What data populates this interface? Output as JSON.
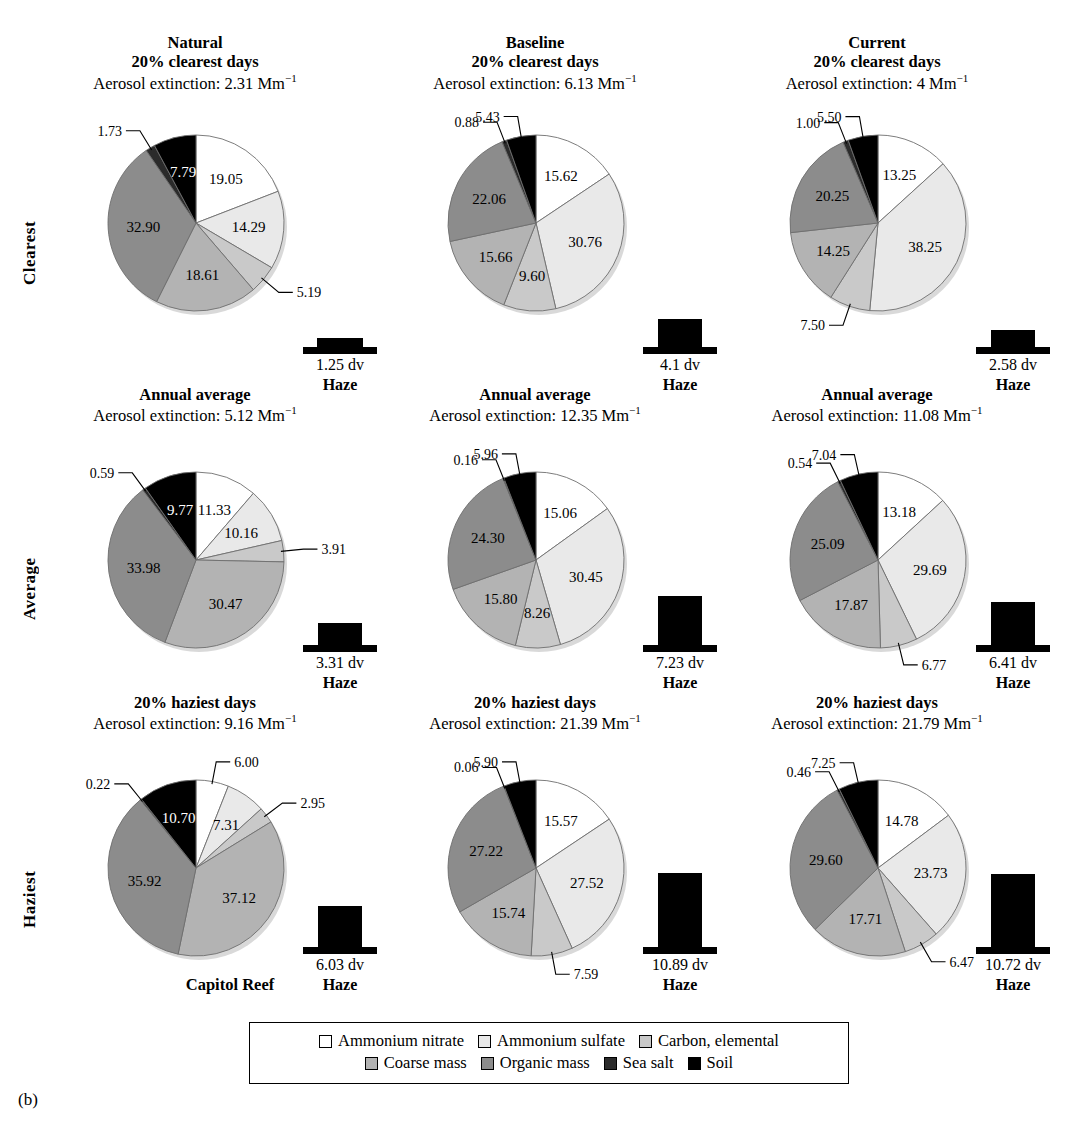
{
  "caption": "(b)",
  "site_label": "Capitol Reef",
  "row_labels": [
    "Clearest",
    "Average",
    "Haziest"
  ],
  "column_titles": [
    "Natural",
    "Baseline",
    "Current"
  ],
  "extinction_prefix": "Aerosol extinction:",
  "extinction_unit": "Mm",
  "extinction_exponent": "−1",
  "haze_word": "Haze",
  "haze_unit": "dv",
  "legend": {
    "items": [
      {
        "label": "Ammonium nitrate",
        "color": "#ffffff"
      },
      {
        "label": "Ammonium sulfate",
        "color": "#e9e9e9"
      },
      {
        "label": "Carbon, elemental",
        "color": "#c9c9c9"
      },
      {
        "label": "Coarse mass",
        "color": "#b3b3b3"
      },
      {
        "label": "Organic mass",
        "color": "#8c8c8c"
      },
      {
        "label": "Sea salt",
        "color": "#2b2b2b"
      },
      {
        "label": "Soil",
        "color": "#000000"
      }
    ]
  },
  "chart_data": {
    "type": "pie",
    "categories": [
      "Ammonium nitrate",
      "Ammonium sulfate",
      "Carbon, elemental",
      "Coarse mass",
      "Organic mass",
      "Sea salt",
      "Soil"
    ],
    "colors": [
      "#ffffff",
      "#e9e9e9",
      "#c9c9c9",
      "#b3b3b3",
      "#8c8c8c",
      "#2b2b2b",
      "#000000"
    ],
    "units": "percent of aerosol extinction",
    "panels": [
      {
        "row": "Clearest",
        "column": "Natural",
        "title_line1": "Natural",
        "title_line2": "20% clearest days",
        "extinction": "2.31",
        "haze": "1.25",
        "values": [
          19.05,
          14.29,
          5.19,
          18.61,
          32.9,
          1.73,
          7.79
        ],
        "inside": [
          true,
          true,
          false,
          true,
          true,
          false,
          true
        ]
      },
      {
        "row": "Clearest",
        "column": "Baseline",
        "title_line1": "Baseline",
        "title_line2": "20% clearest days",
        "extinction": "6.13",
        "haze": "4.1",
        "values": [
          15.62,
          30.76,
          9.6,
          15.66,
          22.06,
          0.88,
          5.43
        ],
        "inside": [
          true,
          true,
          true,
          true,
          true,
          false,
          false
        ]
      },
      {
        "row": "Clearest",
        "column": "Current",
        "title_line1": "Current",
        "title_line2": "20% clearest days",
        "extinction": "4",
        "haze": "2.58",
        "values": [
          13.25,
          38.25,
          7.5,
          14.25,
          20.25,
          1.0,
          5.5
        ],
        "inside": [
          true,
          true,
          false,
          true,
          true,
          false,
          false
        ]
      },
      {
        "row": "Average",
        "column": "Natural",
        "title_line1": "",
        "title_line2": "Annual average",
        "extinction": "5.12",
        "haze": "3.31",
        "values": [
          11.33,
          10.16,
          3.91,
          30.47,
          33.98,
          0.59,
          9.77
        ],
        "inside": [
          true,
          true,
          false,
          true,
          true,
          false,
          true
        ]
      },
      {
        "row": "Average",
        "column": "Baseline",
        "title_line1": "",
        "title_line2": "Annual average",
        "extinction": "12.35",
        "haze": "7.23",
        "values": [
          15.06,
          30.45,
          8.26,
          15.8,
          24.3,
          0.16,
          5.96
        ],
        "inside": [
          true,
          true,
          true,
          true,
          true,
          false,
          false
        ]
      },
      {
        "row": "Average",
        "column": "Current",
        "title_line1": "",
        "title_line2": "Annual average",
        "extinction": "11.08",
        "haze": "6.41",
        "values": [
          13.18,
          29.69,
          6.77,
          17.87,
          25.09,
          0.54,
          7.04
        ],
        "inside": [
          true,
          true,
          false,
          true,
          true,
          false,
          false
        ]
      },
      {
        "row": "Haziest",
        "column": "Natural",
        "title_line1": "",
        "title_line2": "20% haziest days",
        "extinction": "9.16",
        "haze": "6.03",
        "values": [
          6.0,
          7.31,
          2.95,
          37.12,
          35.92,
          0.22,
          10.7
        ],
        "inside": [
          false,
          true,
          false,
          true,
          true,
          false,
          true
        ]
      },
      {
        "row": "Haziest",
        "column": "Baseline",
        "title_line1": "",
        "title_line2": "20% haziest days",
        "extinction": "21.39",
        "haze": "10.89",
        "values": [
          15.57,
          27.52,
          7.59,
          15.74,
          27.22,
          0.06,
          5.9
        ],
        "inside": [
          true,
          true,
          false,
          true,
          true,
          false,
          false
        ]
      },
      {
        "row": "Haziest",
        "column": "Current",
        "title_line1": "",
        "title_line2": "20% haziest days",
        "extinction": "21.79",
        "haze": "10.72",
        "values": [
          14.78,
          23.73,
          6.47,
          17.71,
          29.6,
          0.46,
          7.25
        ],
        "inside": [
          true,
          true,
          false,
          true,
          true,
          false,
          false
        ]
      }
    ]
  }
}
